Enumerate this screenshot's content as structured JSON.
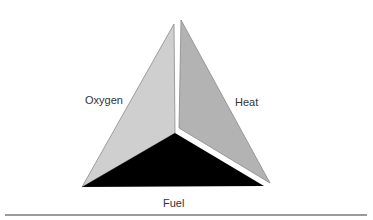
{
  "diagram": {
    "faces": [
      {
        "id": "oxygen",
        "label": "Oxygen",
        "color": "#cfcfcf",
        "stroke": "#8a8a8a"
      },
      {
        "id": "heat",
        "label": "Heat",
        "color": "#b3b3b3",
        "stroke": "#8a8a8a"
      },
      {
        "id": "fuel",
        "label": "Fuel",
        "color": "#000000",
        "stroke": "#000000"
      }
    ],
    "rule_color": "#9a9a9a"
  }
}
